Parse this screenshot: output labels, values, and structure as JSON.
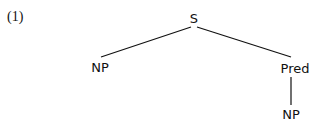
{
  "example": {
    "number": "(1)"
  },
  "tree": {
    "root": {
      "label": "S"
    },
    "left_child": {
      "label": "NP"
    },
    "right_child": {
      "label": "Pred"
    },
    "right_grandchild": {
      "label": "NP"
    },
    "edges": [
      {
        "from": "S",
        "to": "NP"
      },
      {
        "from": "S",
        "to": "Pred"
      },
      {
        "from": "Pred",
        "to": "NP"
      }
    ]
  }
}
